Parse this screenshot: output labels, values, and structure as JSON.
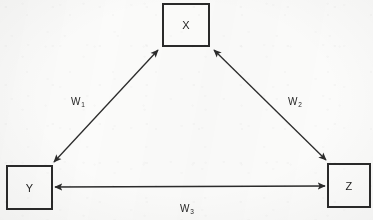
{
  "figure": {
    "type": "node-edge-diagram",
    "background_color": "#fbfbfa",
    "stroke_color": "#2a2a2a"
  },
  "nodes": [
    {
      "id": "x",
      "label": "X",
      "position": "top-center"
    },
    {
      "id": "y",
      "label": "Y",
      "position": "bottom-left"
    },
    {
      "id": "z",
      "label": "Z",
      "position": "bottom-right"
    }
  ],
  "edges": [
    {
      "id": "w1",
      "from": "Y",
      "to": "X",
      "arrow": "double",
      "label_base": "W",
      "label_sub": "1"
    },
    {
      "id": "w2",
      "from": "X",
      "to": "Z",
      "arrow": "double",
      "label_base": "W",
      "label_sub": "2"
    },
    {
      "id": "w3",
      "from": "Y",
      "to": "Z",
      "arrow": "double",
      "label_base": "W",
      "label_sub": "3"
    }
  ]
}
